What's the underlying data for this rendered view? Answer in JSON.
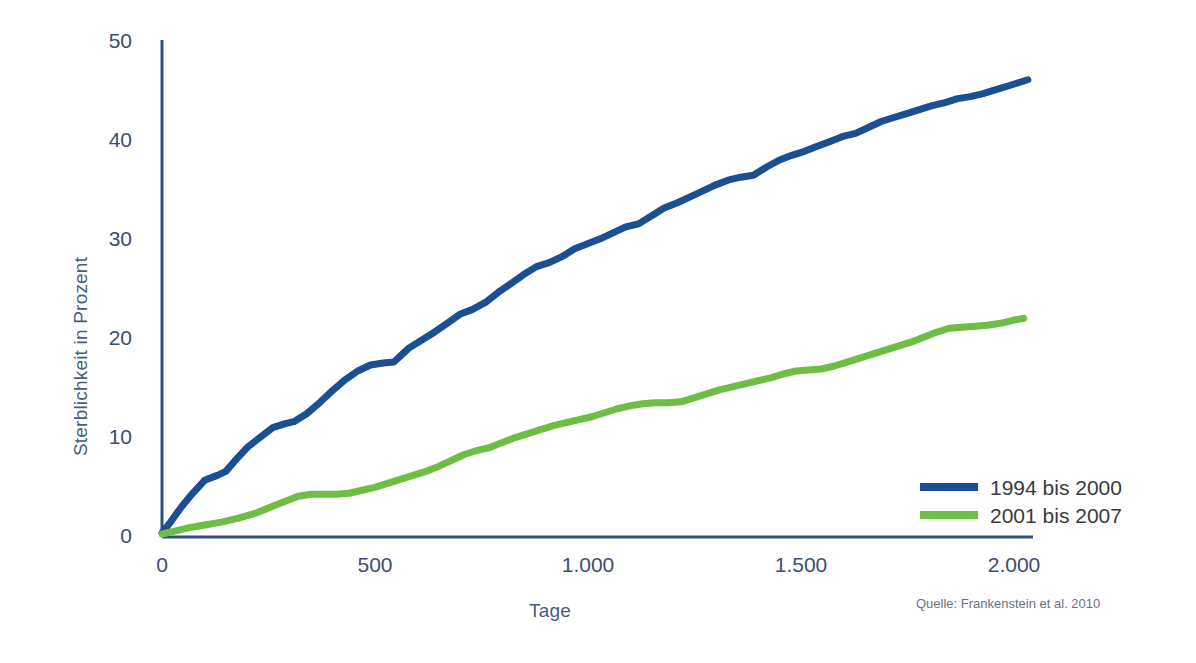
{
  "chart_data": {
    "type": "line",
    "title": "",
    "subtitle": "",
    "xlabel": "Tage",
    "ylabel": "Sterblichkeit in Prozent",
    "xlim": [
      0,
      2050
    ],
    "ylim": [
      0,
      50
    ],
    "xticks": [
      0,
      500,
      1000,
      1500,
      2000
    ],
    "xtick_labels": [
      "0",
      "500",
      "1.000",
      "1.500",
      "2.000"
    ],
    "yticks": [
      0,
      10,
      20,
      30,
      40,
      50
    ],
    "ytick_labels": [
      "0",
      "10",
      "20",
      "30",
      "40",
      "50"
    ],
    "grid": false,
    "legend_position": "bottom-right",
    "source": "Quelle: Frankenstein et al. 2010",
    "colors": {
      "series_1994_2000": "#1a5091",
      "series_2001_2007": "#6cbe45",
      "axis": "#2e4f86",
      "tick_text": "#3c4d73",
      "axis_title": "#4a5b80",
      "legend_text": "#3a3a3a",
      "source_text": "#6d7280",
      "background": "#ffffff"
    },
    "series": [
      {
        "name": "1994 bis 2000",
        "color": "#1a5091",
        "x": [
          0,
          20,
          45,
          70,
          100,
          130,
          150,
          170,
          200,
          230,
          260,
          290,
          310,
          340,
          370,
          400,
          430,
          460,
          490,
          520,
          545,
          560,
          580,
          610,
          640,
          670,
          700,
          730,
          760,
          790,
          820,
          850,
          880,
          910,
          940,
          970,
          1000,
          1030,
          1060,
          1090,
          1120,
          1150,
          1180,
          1210,
          1240,
          1270,
          1300,
          1330,
          1360,
          1390,
          1420,
          1450,
          1480,
          1510,
          1540,
          1570,
          1600,
          1630,
          1660,
          1690,
          1720,
          1750,
          1780,
          1810,
          1840,
          1870,
          1900,
          1930,
          1960,
          1990,
          2020,
          2035
        ],
        "y": [
          0.4,
          1.5,
          3.0,
          4.3,
          5.7,
          6.2,
          6.6,
          7.6,
          9.0,
          10.0,
          11.0,
          11.4,
          11.6,
          12.4,
          13.5,
          14.7,
          15.8,
          16.7,
          17.3,
          17.5,
          17.6,
          18.2,
          19.0,
          19.8,
          20.6,
          21.5,
          22.4,
          22.9,
          23.6,
          24.6,
          25.5,
          26.4,
          27.2,
          27.6,
          28.2,
          29.0,
          29.5,
          30.0,
          30.6,
          31.2,
          31.5,
          32.3,
          33.1,
          33.6,
          34.2,
          34.8,
          35.4,
          35.9,
          36.2,
          36.4,
          37.2,
          37.9,
          38.4,
          38.8,
          39.3,
          39.8,
          40.3,
          40.6,
          41.2,
          41.8,
          42.2,
          42.6,
          43.0,
          43.4,
          43.7,
          44.1,
          44.3,
          44.6,
          45.0,
          45.4,
          45.8,
          46.0
        ]
      },
      {
        "name": "2001 bis 2007",
        "color": "#6cbe45",
        "x": [
          0,
          30,
          60,
          100,
          140,
          180,
          220,
          260,
          290,
          320,
          350,
          380,
          410,
          440,
          470,
          500,
          530,
          560,
          590,
          620,
          650,
          680,
          710,
          740,
          770,
          800,
          830,
          860,
          890,
          920,
          950,
          980,
          1010,
          1040,
          1070,
          1100,
          1130,
          1160,
          1190,
          1220,
          1250,
          1280,
          1310,
          1340,
          1370,
          1400,
          1430,
          1460,
          1490,
          1520,
          1550,
          1580,
          1610,
          1640,
          1670,
          1700,
          1730,
          1760,
          1790,
          1820,
          1850,
          1880,
          1910,
          1940,
          1970,
          2000,
          2025
        ],
        "y": [
          0.3,
          0.6,
          0.9,
          1.2,
          1.5,
          1.9,
          2.4,
          3.1,
          3.6,
          4.1,
          4.3,
          4.3,
          4.3,
          4.4,
          4.7,
          5.0,
          5.4,
          5.8,
          6.2,
          6.6,
          7.1,
          7.7,
          8.3,
          8.7,
          9.0,
          9.5,
          10.0,
          10.4,
          10.8,
          11.2,
          11.5,
          11.8,
          12.1,
          12.5,
          12.9,
          13.2,
          13.4,
          13.5,
          13.5,
          13.6,
          14.0,
          14.4,
          14.8,
          15.1,
          15.4,
          15.7,
          16.0,
          16.4,
          16.7,
          16.8,
          16.9,
          17.2,
          17.6,
          18.0,
          18.4,
          18.8,
          19.2,
          19.6,
          20.1,
          20.6,
          21.0,
          21.1,
          21.2,
          21.3,
          21.5,
          21.8,
          22.0
        ]
      }
    ]
  },
  "legend": {
    "items": [
      {
        "label": "1994 bis 2000",
        "color": "#1a5091"
      },
      {
        "label": "2001 bis 2007",
        "color": "#6cbe45"
      }
    ]
  },
  "axes": {
    "y_title": "Sterblichkeit in Prozent",
    "x_title": "Tage",
    "y_ticks": [
      "50",
      "40",
      "30",
      "20",
      "10",
      "0"
    ],
    "x_ticks": [
      "0",
      "500",
      "1.000",
      "1.500",
      "2.000"
    ]
  },
  "source": "Quelle: Frankenstein et al. 2010"
}
